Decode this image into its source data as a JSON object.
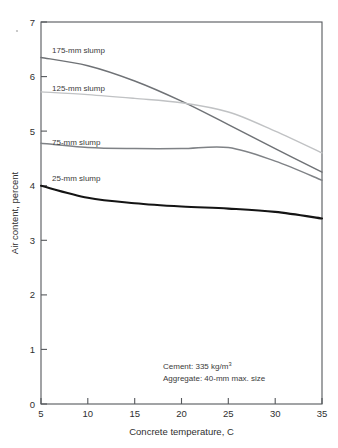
{
  "chart_data": {
    "type": "line",
    "title": "",
    "xlabel": "Concrete temperature, C",
    "ylabel": "Air content, percent",
    "xlim": [
      5,
      35
    ],
    "ylim": [
      0,
      7
    ],
    "xticks": [
      5,
      10,
      15,
      20,
      25,
      30,
      35
    ],
    "yticks": [
      0,
      1,
      2,
      3,
      4,
      5,
      6,
      7
    ],
    "grid": false,
    "legend_position": "inline-labels",
    "x": [
      5,
      10,
      15,
      20,
      25,
      30,
      35
    ],
    "series": [
      {
        "name": "175-mm slump",
        "label": "175-mm slump",
        "color": "#6f7276",
        "width": 1.5,
        "values": [
          6.35,
          6.2,
          5.92,
          5.55,
          5.12,
          4.68,
          4.25
        ]
      },
      {
        "name": "125-mm slump",
        "label": "125-mm slump",
        "color": "#c0c2c4",
        "width": 1.4,
        "values": [
          5.72,
          5.67,
          5.6,
          5.52,
          5.35,
          5.0,
          4.6
        ]
      },
      {
        "name": "75-mm slump",
        "label": "75-mm slump",
        "color": "#7f8286",
        "width": 1.5,
        "values": [
          4.78,
          4.7,
          4.68,
          4.68,
          4.7,
          4.45,
          4.1
        ]
      },
      {
        "name": "25-mm slump",
        "label": "25-mm slump",
        "color": "#141414",
        "width": 2.1,
        "values": [
          4.0,
          3.78,
          3.68,
          3.62,
          3.58,
          3.52,
          3.4
        ]
      }
    ],
    "annotations": [
      {
        "text": "Cement: 335 kg/m",
        "sup": "3"
      },
      {
        "text": "Aggregate: 40-mm max. size",
        "sup": ""
      }
    ]
  },
  "axis": {
    "x_title": "Concrete temperature, C",
    "y_title": "Air content, percent",
    "x_tick_labels": [
      "5",
      "10",
      "15",
      "20",
      "25",
      "30",
      "35"
    ],
    "y_tick_labels": [
      "0",
      "1",
      "2",
      "3",
      "4",
      "5",
      "6",
      "7"
    ]
  },
  "series_labels": {
    "s175": "175-mm slump",
    "s125": "125-mm slump",
    "s75": "75-mm slump",
    "s25": "25-mm slump"
  },
  "annotation": {
    "cement_line": "Cement: 335 kg/m",
    "cement_sup": "3",
    "aggregate_line": "Aggregate: 40-mm max. size"
  }
}
